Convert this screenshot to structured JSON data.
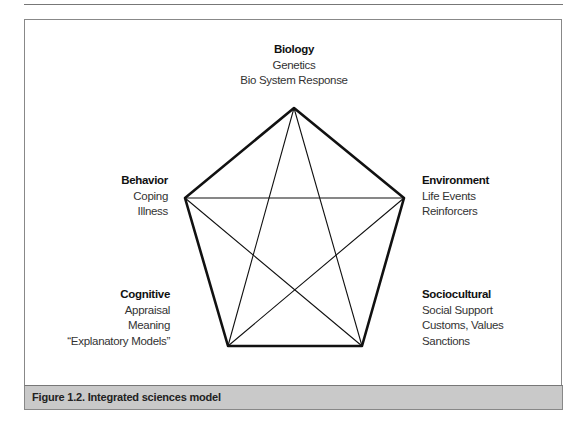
{
  "diagram": {
    "nodes": [
      {
        "id": "biology",
        "title": "Biology",
        "lines": [
          "Genetics",
          "Bio System Response"
        ]
      },
      {
        "id": "environment",
        "title": "Environment",
        "lines": [
          "Life Events",
          "Reinforcers"
        ]
      },
      {
        "id": "sociocultural",
        "title": "Sociocultural",
        "lines": [
          "Social Support",
          "Customs, Values",
          "Sanctions"
        ]
      },
      {
        "id": "cognitive",
        "title": "Cognitive",
        "lines": [
          "Appraisal",
          "Meaning",
          "“Explanatory Models”"
        ]
      },
      {
        "id": "behavior",
        "title": "Behavior",
        "lines": [
          "Coping",
          "Illness"
        ]
      }
    ],
    "shape": "pentagon with inscribed pentagram (all vertices connected)"
  },
  "caption": "Figure 1.2. Integrated sciences model"
}
